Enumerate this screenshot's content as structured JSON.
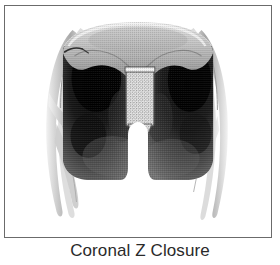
{
  "figure": {
    "caption": "Coronal Z Closure",
    "alt_description": "Halftone anatomical illustration of a knee joint viewed coronally, showing the femoral condyles with a speckled bone graft wedge seated in the intercondylar notch and overlapping soft-tissue flaps closed in a Z pattern on both sides.",
    "frame": {
      "border_color": "#6b6b6b",
      "background_color": "#ffffff",
      "border_width_px": 1
    },
    "caption_color": "#2a2a2a",
    "parts": [
      {
        "name": "femoral-condyle-left",
        "tone": "dark",
        "color": "#1a1a1a"
      },
      {
        "name": "femoral-condyle-right",
        "tone": "dark",
        "color": "#1f1f1f"
      },
      {
        "name": "articular-cartilage-arch",
        "tone": "light-gray",
        "color": "#c9c9c9"
      },
      {
        "name": "bone-graft-wedge",
        "tone": "speckled-light",
        "color": "#dddddd"
      },
      {
        "name": "intercondylar-notch",
        "tone": "white",
        "color": "#ffffff"
      },
      {
        "name": "soft-tissue-flap-left",
        "tone": "light-gray",
        "color": "#cfcfcf"
      },
      {
        "name": "soft-tissue-flap-right",
        "tone": "light-gray",
        "color": "#cfcfcf"
      },
      {
        "name": "suture-line",
        "tone": "dark-line",
        "color": "#3a3a3a"
      }
    ]
  }
}
